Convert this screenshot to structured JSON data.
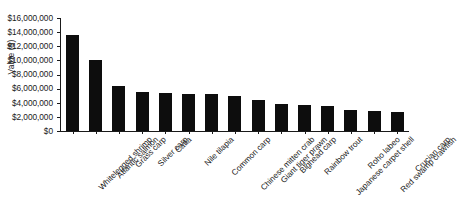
{
  "chart_data": {
    "type": "bar",
    "title": "",
    "xlabel": "",
    "ylabel": "Value ($)",
    "ylim": [
      0,
      16000000
    ],
    "ytick_step": 2000000,
    "grid": false,
    "legend": "none",
    "bar_color": "#0d0d0d",
    "axis_color": "#1a1a1a",
    "background_color": "#ffffff",
    "x_label_rotation_deg": -45,
    "categories": [
      "Whitelegged shrimp",
      "Atlantic salmon",
      "Grass carp",
      "Silver carp",
      "Catla",
      "Nile tilapia",
      "Common carp",
      "Chinese mitten crab",
      "Giant tiger prawn",
      "Bighead carp",
      "Rainbow trout",
      "Japanese carpet shell",
      "Roho labeo",
      "Red swamp crawfish",
      "Crucian carp"
    ],
    "values": [
      13600000,
      10000000,
      6400000,
      5500000,
      5450000,
      5300000,
      5200000,
      5000000,
      4450000,
      3850000,
      3750000,
      3600000,
      3000000,
      2900000,
      2700000
    ],
    "ytick_labels": [
      "$16,000,000",
      "$14,000,000",
      "$12,000,000",
      "$10,000,000",
      "$8,000,000",
      "$6,000,000",
      "$4,000,000",
      "$2,000,000",
      "$0"
    ],
    "ytick_values": [
      16000000,
      14000000,
      12000000,
      10000000,
      8000000,
      6000000,
      4000000,
      2000000,
      0
    ]
  }
}
